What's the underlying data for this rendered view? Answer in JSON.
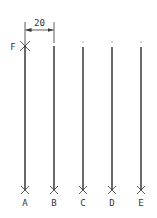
{
  "diagram": {
    "line_color": "#1a1a1a",
    "label_color": "#333333",
    "dimension": {
      "label": "20",
      "x1": 25,
      "x2": 54,
      "y": 30,
      "text_y": 25
    },
    "start_point": {
      "label": "F",
      "x": 25,
      "y": 46
    },
    "lines": [
      {
        "label": "A",
        "x": 25,
        "y_top": 46,
        "y_bottom": 190
      },
      {
        "label": "B",
        "x": 54,
        "y_top": 46,
        "y_bottom": 190
      },
      {
        "label": "C",
        "x": 83,
        "y_top": 47,
        "y_bottom": 190
      },
      {
        "label": "D",
        "x": 112,
        "y_top": 47,
        "y_bottom": 190
      },
      {
        "label": "E",
        "x": 141,
        "y_top": 47,
        "y_bottom": 190
      }
    ],
    "label_y": 203
  }
}
